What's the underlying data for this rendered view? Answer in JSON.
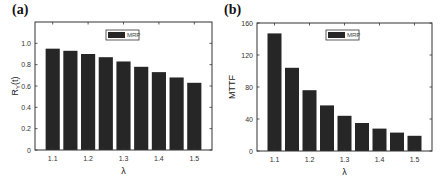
{
  "chart_data": [
    {
      "panel": "(a)",
      "type": "bar",
      "title": "",
      "xlabel": "λ",
      "ylabel": "R_Y(t)",
      "ylabel_main": "R",
      "ylabel_sub": "Y",
      "ylabel_tail": "(t)",
      "x": [
        1.1,
        1.15,
        1.2,
        1.25,
        1.3,
        1.35,
        1.4,
        1.45,
        1.5
      ],
      "series": [
        {
          "name": "MRP",
          "values": [
            0.95,
            0.93,
            0.9,
            0.87,
            0.83,
            0.78,
            0.73,
            0.68,
            0.63
          ]
        }
      ],
      "xticks": [
        "1.1",
        "1.2",
        "1.3",
        "1.4",
        "1.5"
      ],
      "yticks": [
        "0",
        "0.2",
        "0.4",
        "0.6",
        "0.8",
        "1.0"
      ],
      "ylim": [
        0,
        1.2
      ],
      "xlim": [
        1.05,
        1.55
      ],
      "legend": {
        "position": "top-center",
        "entries": [
          "MRP"
        ]
      },
      "grid": false,
      "bar_color": "#262626"
    },
    {
      "panel": "(b)",
      "type": "bar",
      "title": "",
      "xlabel": "λ",
      "ylabel": "MTTF",
      "x": [
        1.1,
        1.15,
        1.2,
        1.25,
        1.3,
        1.35,
        1.4,
        1.45,
        1.5
      ],
      "series": [
        {
          "name": "MRP",
          "values": [
            147,
            104,
            76,
            57,
            44,
            35,
            28,
            23,
            19
          ]
        }
      ],
      "xticks": [
        "1.1",
        "1.2",
        "1.3",
        "1.4",
        "1.5"
      ],
      "yticks": [
        "0",
        "40",
        "80",
        "120",
        "160"
      ],
      "ylim": [
        0,
        160
      ],
      "xlim": [
        1.05,
        1.55
      ],
      "legend": {
        "position": "top-center",
        "entries": [
          "MRP"
        ]
      },
      "grid": false,
      "bar_color": "#262626"
    }
  ],
  "panels": {
    "a": {
      "label": "(a)"
    },
    "b": {
      "label": "(b)"
    }
  }
}
